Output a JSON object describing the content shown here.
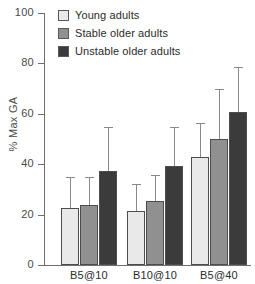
{
  "chart_data": {
    "type": "bar",
    "title": "",
    "xlabel": "",
    "ylabel": "% Max GA",
    "categories": [
      "B5@10",
      "B10@10",
      "B5@40"
    ],
    "ylim": [
      0,
      100
    ],
    "yticks": [
      0,
      20,
      40,
      60,
      80,
      100
    ],
    "ytick_labels": [
      "0",
      "20",
      "40",
      "60",
      "80",
      "100"
    ],
    "grid": false,
    "legend_position": "top-left",
    "errorbars": "upper-only",
    "series": [
      {
        "name": "Young adults",
        "color": "#e9e9e9",
        "values": [
          22.6,
          21.4,
          42.9
        ],
        "err_upper": [
          11.9,
          10.3,
          13.1
        ]
      },
      {
        "name": "Stable older adults",
        "color": "#909090",
        "values": [
          23.8,
          25.4,
          50.0
        ],
        "err_upper": [
          10.7,
          9.9,
          19.4
        ]
      },
      {
        "name": "Unstable older adults",
        "color": "#3b3b3b",
        "values": [
          37.3,
          39.3,
          60.7
        ],
        "err_upper": [
          17.1,
          15.1,
          17.5
        ]
      }
    ]
  },
  "axis": {
    "y_label": "% Max GA",
    "y_ticks": [
      "100",
      "80",
      "60",
      "40",
      "20",
      "0"
    ],
    "x_ticks": [
      "B5@10",
      "B10@10",
      "B5@40"
    ]
  },
  "legend": {
    "items": [
      {
        "label": "Young adults",
        "color": "#e9e9e9"
      },
      {
        "label": "Stable older adults",
        "color": "#909090"
      },
      {
        "label": "Unstable older adults",
        "color": "#3b3b3b"
      }
    ]
  }
}
